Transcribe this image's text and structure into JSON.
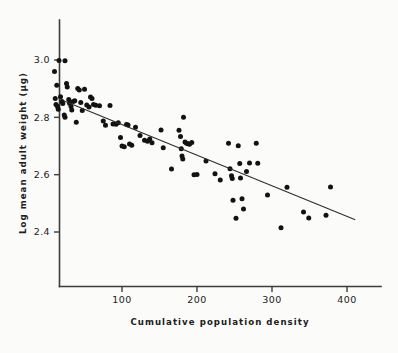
{
  "chart_data": {
    "type": "scatter",
    "title": "",
    "xlabel": "Cumulative population density",
    "ylabel": "Log mean adult weight (µg)",
    "xlim": [
      0,
      440
    ],
    "ylim": [
      2.28,
      3.06
    ],
    "xticks": [
      100,
      200,
      300,
      400
    ],
    "xticklabels": [
      "100",
      "200",
      "300",
      "400"
    ],
    "yticks": [
      2.4,
      2.6,
      2.8,
      3.0
    ],
    "yticklabels": [
      "2.4",
      "2.6",
      "2.8",
      "3.0"
    ],
    "grid": false,
    "legend": null,
    "marker": "filled-circle",
    "marker_color": "#121212",
    "trend_line": {
      "type": "linear-regression",
      "x_start": 22,
      "y_start": 2.858,
      "x_end": 411,
      "y_end": 2.443
    },
    "points": [
      {
        "x": 10,
        "y": 2.96
      },
      {
        "x": 16,
        "y": 2.998
      },
      {
        "x": 24,
        "y": 2.997
      },
      {
        "x": 13,
        "y": 2.912
      },
      {
        "x": 11,
        "y": 2.866
      },
      {
        "x": 12,
        "y": 2.845
      },
      {
        "x": 14,
        "y": 2.838
      },
      {
        "x": 15,
        "y": 2.828
      },
      {
        "x": 18,
        "y": 2.872
      },
      {
        "x": 20,
        "y": 2.855
      },
      {
        "x": 21,
        "y": 2.848
      },
      {
        "x": 23,
        "y": 2.808
      },
      {
        "x": 24,
        "y": 2.8
      },
      {
        "x": 26,
        "y": 2.918
      },
      {
        "x": 27,
        "y": 2.906
      },
      {
        "x": 29,
        "y": 2.862
      },
      {
        "x": 30,
        "y": 2.849
      },
      {
        "x": 32,
        "y": 2.838
      },
      {
        "x": 33,
        "y": 2.826
      },
      {
        "x": 35,
        "y": 2.855
      },
      {
        "x": 37,
        "y": 2.858
      },
      {
        "x": 39,
        "y": 2.783
      },
      {
        "x": 41,
        "y": 2.901
      },
      {
        "x": 43,
        "y": 2.895
      },
      {
        "x": 45,
        "y": 2.852
      },
      {
        "x": 47,
        "y": 2.824
      },
      {
        "x": 50,
        "y": 2.898
      },
      {
        "x": 53,
        "y": 2.843
      },
      {
        "x": 56,
        "y": 2.836
      },
      {
        "x": 58,
        "y": 2.871
      },
      {
        "x": 60,
        "y": 2.866
      },
      {
        "x": 62,
        "y": 2.845
      },
      {
        "x": 65,
        "y": 2.842
      },
      {
        "x": 70,
        "y": 2.84
      },
      {
        "x": 75,
        "y": 2.787
      },
      {
        "x": 78,
        "y": 2.772
      },
      {
        "x": 84,
        "y": 2.841
      },
      {
        "x": 88,
        "y": 2.777
      },
      {
        "x": 92,
        "y": 2.776
      },
      {
        "x": 95,
        "y": 2.781
      },
      {
        "x": 98,
        "y": 2.73
      },
      {
        "x": 100,
        "y": 2.7
      },
      {
        "x": 103,
        "y": 2.697
      },
      {
        "x": 106,
        "y": 2.775
      },
      {
        "x": 108,
        "y": 2.773
      },
      {
        "x": 110,
        "y": 2.707
      },
      {
        "x": 113,
        "y": 2.703
      },
      {
        "x": 118,
        "y": 2.765
      },
      {
        "x": 124,
        "y": 2.737
      },
      {
        "x": 130,
        "y": 2.72
      },
      {
        "x": 134,
        "y": 2.717
      },
      {
        "x": 137,
        "y": 2.724
      },
      {
        "x": 140,
        "y": 2.711
      },
      {
        "x": 152,
        "y": 2.756
      },
      {
        "x": 155,
        "y": 2.694
      },
      {
        "x": 166,
        "y": 2.62
      },
      {
        "x": 176,
        "y": 2.755
      },
      {
        "x": 178,
        "y": 2.733
      },
      {
        "x": 179,
        "y": 2.69
      },
      {
        "x": 180,
        "y": 2.665
      },
      {
        "x": 181,
        "y": 2.655
      },
      {
        "x": 182,
        "y": 2.8
      },
      {
        "x": 184,
        "y": 2.714
      },
      {
        "x": 186,
        "y": 2.71
      },
      {
        "x": 188,
        "y": 2.708
      },
      {
        "x": 190,
        "y": 2.706
      },
      {
        "x": 193,
        "y": 2.712
      },
      {
        "x": 196,
        "y": 2.6
      },
      {
        "x": 200,
        "y": 2.601
      },
      {
        "x": 212,
        "y": 2.648
      },
      {
        "x": 224,
        "y": 2.603
      },
      {
        "x": 231,
        "y": 2.581
      },
      {
        "x": 242,
        "y": 2.71
      },
      {
        "x": 244,
        "y": 2.621
      },
      {
        "x": 246,
        "y": 2.596
      },
      {
        "x": 247,
        "y": 2.587
      },
      {
        "x": 248,
        "y": 2.511
      },
      {
        "x": 252,
        "y": 2.448
      },
      {
        "x": 255,
        "y": 2.701
      },
      {
        "x": 257,
        "y": 2.639
      },
      {
        "x": 258,
        "y": 2.588
      },
      {
        "x": 260,
        "y": 2.516
      },
      {
        "x": 262,
        "y": 2.48
      },
      {
        "x": 266,
        "y": 2.611
      },
      {
        "x": 270,
        "y": 2.641
      },
      {
        "x": 279,
        "y": 2.71
      },
      {
        "x": 281,
        "y": 2.64
      },
      {
        "x": 294,
        "y": 2.529
      },
      {
        "x": 312,
        "y": 2.415
      },
      {
        "x": 320,
        "y": 2.556
      },
      {
        "x": 342,
        "y": 2.47
      },
      {
        "x": 349,
        "y": 2.449
      },
      {
        "x": 372,
        "y": 2.458
      },
      {
        "x": 378,
        "y": 2.557
      }
    ]
  }
}
